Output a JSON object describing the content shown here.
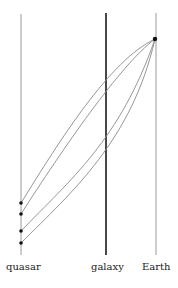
{
  "diagram": {
    "type": "gravitational-lensing-spacetime",
    "worldlines": [
      {
        "id": "quasar",
        "label": "quasar",
        "x": 21,
        "color": "#9a9a9a",
        "width": 1
      },
      {
        "id": "galaxy",
        "label": "galaxy",
        "x": 106,
        "color": "#333333",
        "width": 1.8
      },
      {
        "id": "earth",
        "label": "Earth",
        "x": 156,
        "color": "#9a9a9a",
        "width": 1
      }
    ],
    "observer_event": {
      "x": 155,
      "y": 39
    },
    "emission_events_y": [
      203,
      214,
      231,
      243
    ],
    "ray_color": "#8a8a8a"
  },
  "labels": {
    "quasar": "quasar",
    "galaxy": "galaxy",
    "earth": "Earth"
  }
}
